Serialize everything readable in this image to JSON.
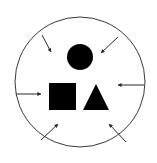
{
  "diagram": {
    "colors": {
      "stroke": "#3a3a3a",
      "fill": "#000000",
      "background": "#ffffff"
    },
    "boundary": {
      "shape": "circle",
      "cx": 80,
      "cy": 82,
      "r": 65
    },
    "shapes": [
      {
        "name": "circle",
        "cx": 80,
        "cy": 57,
        "r": 13
      },
      {
        "name": "square",
        "x": 49,
        "y": 83,
        "size": 27
      },
      {
        "name": "triangle",
        "points": "96,84 83,110 109,110"
      }
    ],
    "arrows": [
      {
        "name": "top-left",
        "x1": 42,
        "y1": 35,
        "x2": 51,
        "y2": 52
      },
      {
        "name": "top-right",
        "x1": 118,
        "y1": 37,
        "x2": 101,
        "y2": 53
      },
      {
        "name": "left",
        "x1": 16,
        "y1": 94,
        "x2": 41,
        "y2": 94
      },
      {
        "name": "right",
        "x1": 144,
        "y1": 85,
        "x2": 118,
        "y2": 85
      },
      {
        "name": "bottom-left",
        "x1": 41,
        "y1": 140,
        "x2": 58,
        "y2": 124
      },
      {
        "name": "bottom-right",
        "x1": 126,
        "y1": 142,
        "x2": 109,
        "y2": 124
      }
    ]
  }
}
